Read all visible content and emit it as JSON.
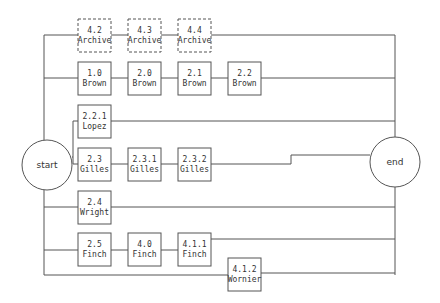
{
  "diagram": {
    "start": {
      "label": "start",
      "cx": 47,
      "cy": 165,
      "r": 25
    },
    "end": {
      "label": "end",
      "cx": 395,
      "cy": 162,
      "r": 25
    },
    "nodes": [
      {
        "id": "4.2",
        "name": "Archive",
        "x": 78,
        "y": 19,
        "dashed": true
      },
      {
        "id": "4.3",
        "name": "Archive",
        "x": 128,
        "y": 19,
        "dashed": true
      },
      {
        "id": "4.4",
        "name": "Archive",
        "x": 178,
        "y": 19,
        "dashed": true
      },
      {
        "id": "1.0",
        "name": "Brown",
        "x": 78,
        "y": 62,
        "dashed": false
      },
      {
        "id": "2.0",
        "name": "Brown",
        "x": 128,
        "y": 62,
        "dashed": false
      },
      {
        "id": "2.1",
        "name": "Brown",
        "x": 178,
        "y": 62,
        "dashed": false
      },
      {
        "id": "2.2",
        "name": "Brown",
        "x": 228,
        "y": 62,
        "dashed": false
      },
      {
        "id": "2.2.1",
        "name": "Lopez",
        "x": 78,
        "y": 105,
        "dashed": false
      },
      {
        "id": "2.3",
        "name": "Gilles",
        "x": 78,
        "y": 148,
        "dashed": false
      },
      {
        "id": "2.3.1",
        "name": "Gilles",
        "x": 128,
        "y": 148,
        "dashed": false
      },
      {
        "id": "2.3.2",
        "name": "Gilles",
        "x": 178,
        "y": 148,
        "dashed": false
      },
      {
        "id": "2.4",
        "name": "Wright",
        "x": 78,
        "y": 191,
        "dashed": false
      },
      {
        "id": "2.5",
        "name": "Finch",
        "x": 78,
        "y": 233,
        "dashed": false
      },
      {
        "id": "4.0",
        "name": "Finch",
        "x": 128,
        "y": 233,
        "dashed": false
      },
      {
        "id": "4.1.1",
        "name": "Finch",
        "x": 178,
        "y": 233,
        "dashed": false
      },
      {
        "id": "4.1.2",
        "name": "Wornier",
        "x": 228,
        "y": 258,
        "dashed": false
      }
    ]
  }
}
